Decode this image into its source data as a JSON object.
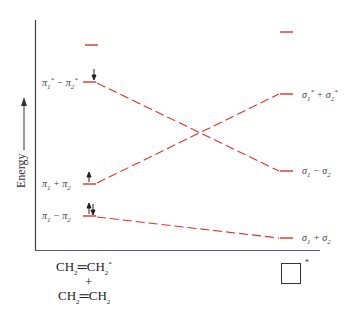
{
  "diagram": {
    "type": "molecular orbital correlation diagram",
    "y_axis_label": "Energy",
    "accent_color": "#e0312f",
    "left": {
      "reactant_top": "CH2=CH2*",
      "plus": "+",
      "reactant_bottom": "CH2=CH2",
      "levels": [
        {
          "label": "",
          "y": 45
        },
        {
          "label": "π1* − π2*",
          "y": 82,
          "electrons": "↓"
        },
        {
          "label": "π1 + π2",
          "y": 184,
          "electrons": "↑"
        },
        {
          "label": "π1 − π2",
          "y": 216,
          "electrons": "↑↓"
        }
      ]
    },
    "right": {
      "product": "cyclobutane (square)",
      "product_star": "*",
      "levels": [
        {
          "label": "",
          "y": 32
        },
        {
          "label": "σ1* + σ2*",
          "y": 94
        },
        {
          "label": "σ1 − σ2",
          "y": 171
        },
        {
          "label": "σ1 + σ2",
          "y": 238
        }
      ]
    },
    "correlations": [
      {
        "from": "π1* − π2*",
        "to": "σ1 − σ2"
      },
      {
        "from": "π1 + π2",
        "to": "σ1* + σ2*"
      },
      {
        "from": "π1 − π2",
        "to": "σ1 + σ2"
      }
    ]
  }
}
